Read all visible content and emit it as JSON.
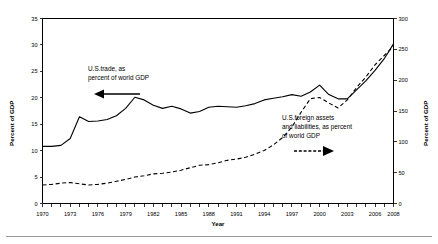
{
  "chart_data": {
    "type": "line",
    "title": "",
    "xlabel": "Year",
    "ylabel": "Percent of GDP",
    "y2label": "Percent of GDP",
    "xlim": [
      1970,
      2008
    ],
    "ylim": [
      0,
      35
    ],
    "y2lim": [
      0,
      300
    ],
    "grid": false,
    "legend": "annotations-with-arrows",
    "xticks_labeled": [
      1970,
      1973,
      1976,
      1979,
      1982,
      1985,
      1988,
      1991,
      1994,
      1997,
      2000,
      2003,
      2006,
      2008
    ],
    "xticks_minor_step": 1,
    "yticks_left": [
      0,
      5,
      10,
      15,
      20,
      25,
      30,
      35
    ],
    "yticks_right": [
      0,
      50,
      100,
      150,
      200,
      250,
      300
    ],
    "x": [
      1970,
      1971,
      1972,
      1973,
      1974,
      1975,
      1976,
      1977,
      1978,
      1979,
      1980,
      1981,
      1982,
      1983,
      1984,
      1985,
      1986,
      1987,
      1988,
      1989,
      1990,
      1991,
      1992,
      1993,
      1994,
      1995,
      1996,
      1997,
      1998,
      1999,
      2000,
      2001,
      2002,
      2003,
      2004,
      2005,
      2006,
      2007,
      2008
    ],
    "series": [
      {
        "name": "U.S.trade, as percent of world GDP",
        "axis": "left",
        "style": "solid",
        "color": "#000000",
        "values": [
          10.8,
          10.8,
          11.0,
          12.3,
          16.4,
          15.5,
          15.6,
          15.9,
          16.6,
          18.0,
          20.1,
          19.6,
          18.6,
          18.0,
          18.4,
          17.9,
          17.1,
          17.4,
          18.2,
          18.4,
          18.3,
          18.2,
          18.5,
          18.9,
          19.6,
          19.9,
          20.2,
          20.6,
          20.3,
          21.1,
          22.4,
          20.6,
          19.8,
          19.8,
          21.5,
          23.2,
          25.2,
          27.4,
          30.2
        ]
      },
      {
        "name": "U.S.foreign assets and liabilities, as percent of world GDP",
        "axis": "right",
        "style": "dashed",
        "color": "#000000",
        "values": [
          30,
          31,
          33,
          34,
          32,
          30,
          31,
          33,
          36,
          39,
          43,
          45,
          48,
          49,
          51,
          54,
          58,
          62,
          63,
          66,
          70,
          72,
          75,
          80,
          86,
          95,
          107,
          124,
          148,
          170,
          172,
          163,
          155,
          168,
          188,
          205,
          225,
          240,
          255
        ]
      }
    ],
    "annotations": [
      {
        "name": "trade-annotation",
        "lines": [
          "U.S.trade, as",
          "percent of world GDP"
        ],
        "arrow": "left",
        "arrow_style": "solid"
      },
      {
        "name": "foreign-assets-annotation",
        "lines": [
          "U.S.foreign assets",
          "and liabilities, as percent",
          "of world GDP"
        ],
        "arrow": "right",
        "arrow_style": "dashed"
      }
    ]
  }
}
